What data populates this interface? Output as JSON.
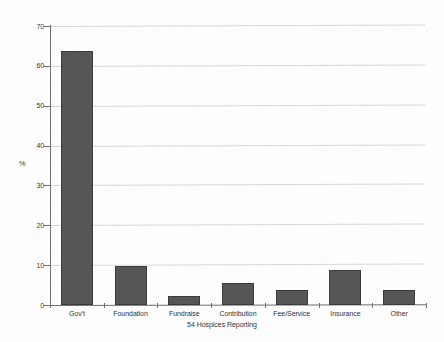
{
  "chart_data": {
    "type": "bar",
    "title": "",
    "subtitle": "54 Hospices Reporting",
    "xlabel": "",
    "ylabel": "%",
    "ylim": [
      0,
      70
    ],
    "yticks": [
      0,
      10,
      20,
      30,
      40,
      50,
      60,
      70
    ],
    "grid": true,
    "legend": "none",
    "categories": [
      "Gov't",
      "Foundation",
      "Fundraise",
      "Contribution",
      "Fee/Service",
      "Insurance",
      "Other"
    ],
    "values": [
      63.7,
      9.8,
      2.3,
      5.5,
      3.8,
      8.8,
      3.7
    ],
    "bar_color": "#565656",
    "bar_edge_color": "#3b3b3b",
    "grid_color": "#d8d8dc",
    "axis_color": "#6f6f6f"
  }
}
